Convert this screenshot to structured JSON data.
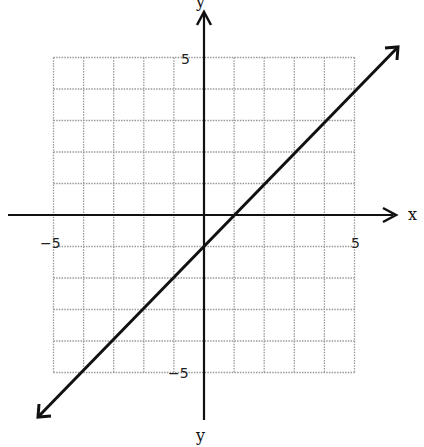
{
  "chart_data": {
    "type": "line",
    "title": "",
    "xlabel": "x",
    "ylabel": "y",
    "ylabel_bottom": "y",
    "xlim": [
      -5,
      5
    ],
    "ylim": [
      -5,
      5
    ],
    "grid": true,
    "grid_style": "dotted",
    "tick_labels": {
      "x_min": "-5",
      "x_max": "5",
      "y_max": "5",
      "y_min": "-5"
    },
    "series": [
      {
        "name": "y = x - 1",
        "equation": "y = x - 1",
        "slope": 1,
        "intercept": -1,
        "points": [
          [
            -5.5,
            -6.5
          ],
          [
            0,
            -1
          ],
          [
            1,
            0
          ],
          [
            6.5,
            5.5
          ]
        ],
        "arrows": "both"
      }
    ]
  },
  "labels": {
    "x_axis": "x",
    "y_axis_top": "y",
    "y_axis_bottom": "y",
    "x_neg5": "−5",
    "x_pos5": "5",
    "y_pos5": "5",
    "y_neg5": "−5"
  },
  "colors": {
    "grid": "#9a9a9a",
    "axis": "#111111",
    "line": "#111111"
  }
}
